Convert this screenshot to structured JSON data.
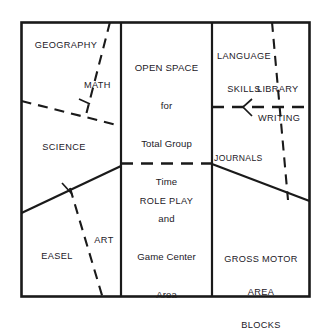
{
  "diagram": {
    "stroke_color": "#1a1a1a",
    "text_color": "#23201f",
    "background_color": "#ffffff",
    "zones": {
      "geography": "GEOGRAPHY",
      "math": "MATH",
      "science": "SCIENCE",
      "easel": "EASEL",
      "art": "ART",
      "open_space_line1": "OPEN SPACE",
      "open_space_line2": "for",
      "open_space_line3": "Total Group",
      "open_space_line4": "Time",
      "open_space_line5": "and",
      "open_space_line6": "Game Center",
      "open_space_line7": "Area",
      "role_play": "ROLE PLAY",
      "language_skills_line1": "LANGUAGE",
      "language_skills_line2": "SKILLS",
      "library": "LIBRARY",
      "writing": "WRITING",
      "journals": "JOURNALS",
      "gross_motor_line1": "GROSS MOTOR",
      "gross_motor_line2": "AREA",
      "gross_motor_line3": "BLOCKS"
    }
  }
}
